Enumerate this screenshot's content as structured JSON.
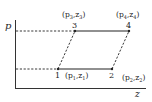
{
  "diagram": {
    "axes": {
      "y_label": "p",
      "x_label": "z"
    },
    "points": [
      {
        "id": "1",
        "label": "1",
        "coord_label_base": "(p",
        "sub1": "1",
        "mid": ",z",
        "sub2": "1",
        "close": ")"
      },
      {
        "id": "2",
        "label": "2",
        "coord_label_base": "(p",
        "sub1": "2",
        "mid": ",z",
        "sub2": "2",
        "close": ")"
      },
      {
        "id": "3",
        "label": "3",
        "coord_label_base": "(p",
        "sub1": "3",
        "mid": ",z",
        "sub2": "3",
        "close": ")"
      },
      {
        "id": "4",
        "label": "4",
        "coord_label_base": "(p",
        "sub1": "4",
        "mid": ",z",
        "sub2": "4",
        "close": ")"
      }
    ],
    "segments": [
      {
        "from": "1",
        "to": "2",
        "style": "solid"
      },
      {
        "from": "3",
        "to": "4",
        "style": "solid"
      },
      {
        "from": "1",
        "to": "3",
        "style": "dashed"
      },
      {
        "from": "2",
        "to": "4",
        "style": "dashed"
      },
      {
        "from": "p-axis",
        "to": "3",
        "style": "dashed"
      },
      {
        "from": "p-axis",
        "to": "1",
        "style": "dashed"
      }
    ],
    "colors": {
      "line": "#222222",
      "background": "#ffffff"
    }
  }
}
